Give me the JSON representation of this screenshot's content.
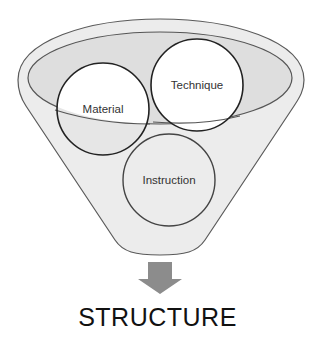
{
  "diagram": {
    "type": "funnel",
    "colors": {
      "funnel_fill": "#ececec",
      "funnel_stroke": "#555555",
      "inner_ellipse_fill": "#dcdcdc",
      "circle_stroke": "#222222",
      "circle_fill_white": "#ffffff",
      "arrow_fill": "#8c8c8c",
      "text": "#333333"
    },
    "circles": [
      {
        "label": "Material",
        "cx": 103,
        "cy": 109,
        "r": 46
      },
      {
        "label": "Technique",
        "cx": 197,
        "cy": 85,
        "r": 46
      },
      {
        "label": "Instruction",
        "cx": 169,
        "cy": 180,
        "r": 46
      }
    ],
    "output_label": "STRUCTURE"
  }
}
